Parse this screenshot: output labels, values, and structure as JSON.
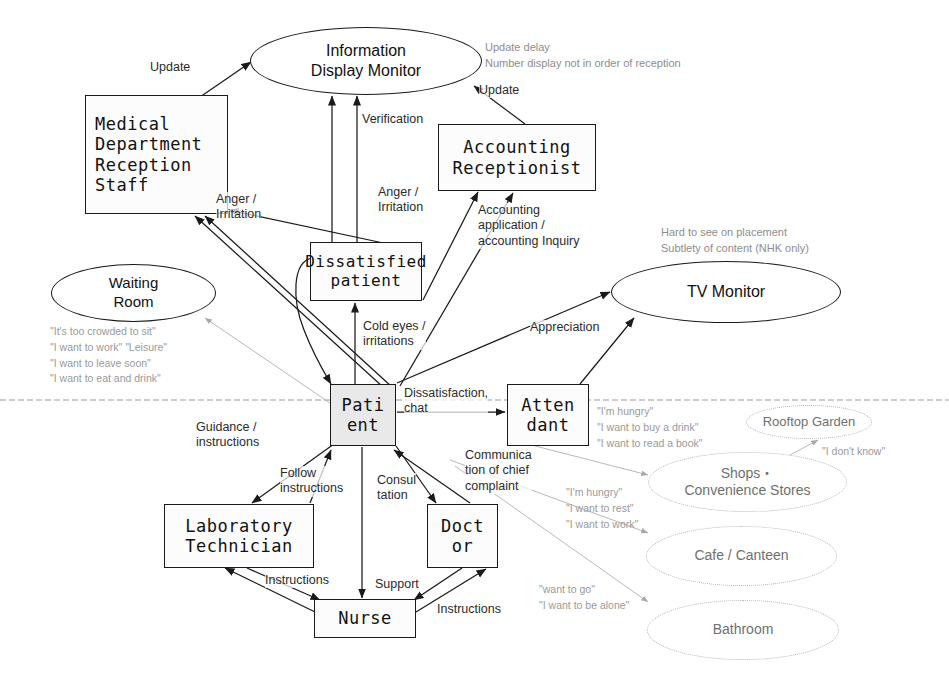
{
  "diagram": {
    "divider_label": "staff-patient boundary line"
  },
  "nodes": [
    {
      "id": "information-display-monitor",
      "label": "Information\nDisplay Monitor",
      "shape": "ellipse",
      "x": 250,
      "y": 27,
      "w": 232,
      "h": 68,
      "font": 16
    },
    {
      "id": "medical-department-reception-staff",
      "label": "Medical\nDepartment\nReception\nStaff",
      "shape": "box",
      "x": 85,
      "y": 95,
      "w": 143,
      "h": 119,
      "font": 17,
      "align": "left"
    },
    {
      "id": "accounting-receptionist",
      "label": "Accounting\nReceptionist",
      "shape": "box",
      "x": 438,
      "y": 124,
      "w": 158,
      "h": 67,
      "font": 17
    },
    {
      "id": "dissatisfied-patient",
      "label": "Dissatisfied\npatient",
      "shape": "box",
      "x": 310,
      "y": 242,
      "w": 112,
      "h": 59,
      "font": 16
    },
    {
      "id": "waiting-room",
      "label": "Waiting\nRoom",
      "shape": "ellipse",
      "x": 51,
      "y": 264,
      "w": 165,
      "h": 58,
      "font": 15
    },
    {
      "id": "tv-monitor",
      "label": "TV Monitor",
      "shape": "ellipse",
      "x": 611,
      "y": 261,
      "w": 230,
      "h": 62,
      "font": 16
    },
    {
      "id": "patient",
      "label": "Pati\nent",
      "shape": "box",
      "x": 330,
      "y": 384,
      "w": 66,
      "h": 62,
      "font": 17,
      "shaded": true
    },
    {
      "id": "attendant",
      "label": "Atten\ndant",
      "shape": "box",
      "x": 507,
      "y": 384,
      "w": 82,
      "h": 62,
      "font": 17
    },
    {
      "id": "rooftop-garden",
      "label": "Rooftop Garden",
      "shape": "ellipse",
      "x": 746,
      "y": 405,
      "w": 126,
      "h": 34,
      "font": 13,
      "faint": true
    },
    {
      "id": "shops-convenience-stores",
      "label": "Shops・\nConvenience Stores",
      "shape": "ellipse",
      "x": 648,
      "y": 452,
      "w": 199,
      "h": 60,
      "font": 14,
      "faint": true
    },
    {
      "id": "laboratory-technician",
      "label": "Laboratory\nTechnician",
      "shape": "box",
      "x": 164,
      "y": 504,
      "w": 150,
      "h": 64,
      "font": 17
    },
    {
      "id": "doctor",
      "label": "Doct\nor",
      "shape": "box",
      "x": 427,
      "y": 504,
      "w": 71,
      "h": 64,
      "font": 17
    },
    {
      "id": "cafe-canteen",
      "label": "Cafe / Canteen",
      "shape": "ellipse",
      "x": 646,
      "y": 526,
      "w": 191,
      "h": 60,
      "font": 14,
      "faint": true
    },
    {
      "id": "nurse",
      "label": "Nurse",
      "shape": "box",
      "x": 314,
      "y": 599,
      "w": 102,
      "h": 39,
      "font": 17
    },
    {
      "id": "bathroom",
      "label": "Bathroom",
      "shape": "ellipse",
      "x": 647,
      "y": 600,
      "w": 192,
      "h": 60,
      "font": 14,
      "faint": true
    }
  ],
  "edge_labels": [
    {
      "id": "update-reception",
      "text": "Update",
      "x": 150,
      "y": 60
    },
    {
      "id": "update-accounting",
      "text": "Update",
      "x": 479,
      "y": 83
    },
    {
      "id": "verification",
      "text": "Verification",
      "x": 362,
      "y": 112
    },
    {
      "id": "anger-irritation-left",
      "text": "Anger /\nIrritation",
      "x": 216,
      "y": 192
    },
    {
      "id": "anger-irritation-right",
      "text": "Anger /\nIrritation",
      "x": 378,
      "y": 185
    },
    {
      "id": "accounting-application",
      "text": "Accounting\napplication /\naccounting Inquiry",
      "x": 478,
      "y": 203
    },
    {
      "id": "cold-eyes-irritations",
      "text": "Cold eyes /\nirritations",
      "x": 363,
      "y": 319
    },
    {
      "id": "appreciation",
      "text": "Appreciation",
      "x": 530,
      "y": 320
    },
    {
      "id": "dissatisfaction-chat",
      "text": "Dissatisfaction,\nchat",
      "x": 404,
      "y": 386
    },
    {
      "id": "guidance-instructions",
      "text": "Guidance /\ninstructions",
      "x": 196,
      "y": 420
    },
    {
      "id": "follow-instructions",
      "text": "Follow\ninstructions",
      "x": 280,
      "y": 466
    },
    {
      "id": "consultation",
      "text": "Consul\ntation",
      "x": 377,
      "y": 473
    },
    {
      "id": "communication-chief-complaint",
      "text": "Communica\ntion of chief\ncomplaint",
      "x": 465,
      "y": 448
    },
    {
      "id": "instructions-lab",
      "text": "Instructions",
      "x": 265,
      "y": 573
    },
    {
      "id": "support",
      "text": "Support",
      "x": 375,
      "y": 577
    },
    {
      "id": "instructions-doctor",
      "text": "Instructions",
      "x": 437,
      "y": 602
    }
  ],
  "notes": [
    {
      "id": "monitor-problems-note",
      "text": "Update delay\nNumber display not in order of reception",
      "x": 485,
      "y": 40
    },
    {
      "id": "tv-monitor-problems-note",
      "text": "Hard to see on placement\nSubtlety of content (NHK only)",
      "x": 661,
      "y": 225
    }
  ],
  "quotes": [
    {
      "id": "waiting-room-quotes",
      "text": "\"It's too crowded to sit\"\n\"I want to work\" \"Leisure\"\n\"I want to leave soon\"\n\"I want to eat and drink\"",
      "x": 50,
      "y": 324
    },
    {
      "id": "attendant-quotes",
      "text": "\"I'm hungry\"\n\"I want to buy a drink\"\n\"I want to read a book\"",
      "x": 597,
      "y": 404
    },
    {
      "id": "dont-know-quote",
      "text": "\"I don't know\"",
      "x": 822,
      "y": 444
    },
    {
      "id": "shops-quotes",
      "text": "\"I'm hungry\"\n\"I want to rest\"\n\"I want to work\"",
      "x": 566,
      "y": 485
    },
    {
      "id": "bathroom-quotes",
      "text": "\"want to go\"\n\"I want to be alone\"",
      "x": 539,
      "y": 582
    }
  ]
}
